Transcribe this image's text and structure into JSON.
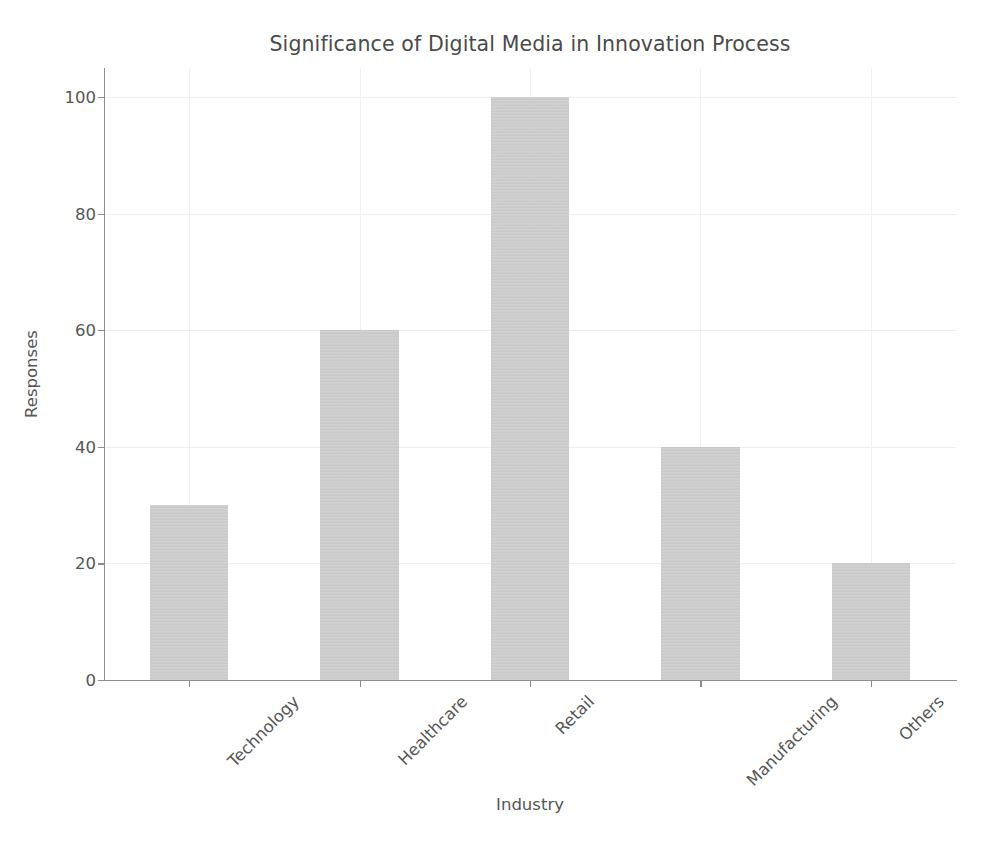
{
  "chart_data": {
    "type": "bar",
    "title": "Significance of Digital Media in Innovation Process",
    "xlabel": "Industry",
    "ylabel": "Responses",
    "categories": [
      "Technology",
      "Healthcare",
      "Retail",
      "Manufacturing",
      "Others"
    ],
    "values": [
      30,
      60,
      100,
      40,
      20
    ],
    "ylim": [
      0,
      105
    ],
    "yticks": [
      0,
      20,
      40,
      60,
      80,
      100
    ],
    "ytick_labels": [
      "0",
      "20",
      "40",
      "60",
      "80",
      "100"
    ],
    "grid": true,
    "legend": null,
    "series": [
      {
        "name": "Responses",
        "values": [
          30,
          60,
          100,
          40,
          20
        ]
      }
    ],
    "bar_color": "#c8c8c8",
    "text_color": "#575757",
    "grid_color": "#ededed",
    "axis_color": "#8e8e8e",
    "background": "#ffffff",
    "xtick_rotation": -45
  }
}
